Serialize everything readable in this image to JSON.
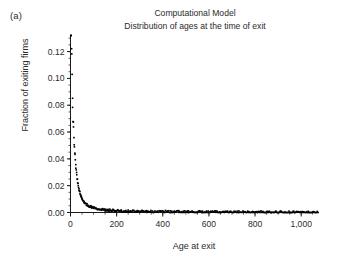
{
  "panel": {
    "label": "(a)"
  },
  "title": {
    "line1": "Computational Model",
    "line2": "Distribution of ages at the time of exit"
  },
  "axes": {
    "xlabel": "Age at exit",
    "ylabel": "Fraction of exiting firms"
  },
  "chart_data": {
    "type": "scatter",
    "title": "Computational Model\nDistribution of ages at the time of exit",
    "subtitle": "Distribution of ages at the time of exit",
    "xlabel": "Age at exit",
    "ylabel": "Fraction of exiting firms",
    "panel_label": "(a)",
    "xlim": [
      0,
      1075
    ],
    "ylim": [
      0.0,
      0.132
    ],
    "xticks": [
      0,
      200,
      400,
      600,
      800,
      1000
    ],
    "xticklabels": [
      "0",
      "200",
      "400",
      "600",
      "800",
      "1,000"
    ],
    "yticks": [
      0.0,
      0.02,
      0.04,
      0.06,
      0.08,
      0.1,
      0.12
    ],
    "yticklabels": [
      "0.00",
      "0.02",
      "0.04",
      "0.06",
      "0.08",
      "0.10",
      "0.12"
    ],
    "x_minor_tick_interval": 50,
    "y_minor_tick_interval": 0.005,
    "grid": false,
    "legend": null,
    "marker": "square",
    "marker_color": "#000000",
    "marker_size": 1.6,
    "note": "Sharply decaying distribution: peak clipped at top of axis near age 0, rapid decay to near zero by age ~120, then a long noisy near-zero tail out past age 1,000.",
    "x": [
      1,
      3,
      5,
      7,
      9,
      11,
      13,
      15,
      17,
      19,
      21,
      23,
      25,
      27,
      29,
      31,
      33,
      35,
      37,
      39,
      41,
      43,
      45,
      47,
      49,
      51,
      55,
      59,
      63,
      67,
      71,
      75,
      79,
      83,
      87,
      91,
      95,
      99,
      105,
      111,
      117,
      123,
      129,
      135,
      141,
      147,
      153,
      159,
      165,
      171,
      177,
      183,
      189,
      195,
      201,
      210,
      220,
      230,
      240,
      250,
      260,
      270,
      280,
      290,
      300,
      315,
      330,
      345,
      360,
      375,
      390,
      405,
      420,
      435,
      450,
      470,
      490,
      510,
      530,
      550,
      570,
      590,
      610,
      630,
      650,
      670,
      690,
      710,
      730,
      750,
      770,
      790,
      810,
      830,
      850,
      870,
      890,
      910,
      930,
      950,
      970,
      990,
      1010,
      1030,
      1050
    ],
    "y": [
      0.131,
      0.1295,
      0.118,
      0.099,
      0.082,
      0.07,
      0.0625,
      0.056,
      0.0495,
      0.044,
      0.039,
      0.0348,
      0.031,
      0.0282,
      0.0258,
      0.0232,
      0.021,
      0.019,
      0.0174,
      0.016,
      0.0147,
      0.0136,
      0.0125,
      0.0116,
      0.0108,
      0.01,
      0.0089,
      0.008,
      0.0072,
      0.0065,
      0.0059,
      0.0054,
      0.005,
      0.0046,
      0.0043,
      0.004,
      0.0037,
      0.0035,
      0.0032,
      0.0029,
      0.0027,
      0.0025,
      0.0024,
      0.0022,
      0.0021,
      0.002,
      0.0019,
      0.0018,
      0.0017,
      0.0017,
      0.0016,
      0.0015,
      0.0015,
      0.0014,
      0.0014,
      0.0013,
      0.0013,
      0.0012,
      0.0012,
      0.0011,
      0.0011,
      0.0011,
      0.001,
      0.001,
      0.001,
      0.0009,
      0.0009,
      0.0008,
      0.0008,
      0.0008,
      0.0007,
      0.0007,
      0.0007,
      0.0006,
      0.0006,
      0.0006,
      0.0005,
      0.0005,
      0.0005,
      0.0005,
      0.0004,
      0.0004,
      0.0004,
      0.0004,
      0.0004,
      0.0003,
      0.0003,
      0.0003,
      0.0003,
      0.0003,
      0.0003,
      0.0002,
      0.0002,
      0.0002,
      0.0002,
      0.0002,
      0.0002,
      0.0002,
      0.0002,
      0.0002,
      0.0001,
      0.0001,
      0.0001,
      0.0001,
      0.0001
    ]
  }
}
